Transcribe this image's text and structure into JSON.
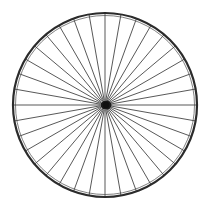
{
  "image": {
    "subject": "bicycle-wheel",
    "description": "Front view of a spoked bicycle wheel rim",
    "width": 211,
    "height": 210,
    "background_color": "#ffffff"
  },
  "wheel": {
    "center_x": 105,
    "center_y": 105,
    "rim": {
      "radius": 92,
      "stroke_color": "#2b2b2b",
      "stroke_width": 2.2,
      "fill": "none"
    },
    "inner_rim": {
      "radius": 89.5,
      "stroke_color": "#4a4a4a",
      "stroke_width": 0.7,
      "fill": "none"
    },
    "spokes": {
      "count": 36,
      "start_radius": 5,
      "end_radius": 91,
      "stroke_color": "#3a3a3a",
      "stroke_width": 0.85,
      "angle_offset_deg": 0
    },
    "hub": {
      "center_x": 106,
      "center_y": 105,
      "width": 11,
      "height": 9,
      "radius": 1.5,
      "fill_color": "#1c1c1c"
    },
    "hub_core": {
      "radius": 3.2,
      "fill_color": "#111111"
    }
  }
}
